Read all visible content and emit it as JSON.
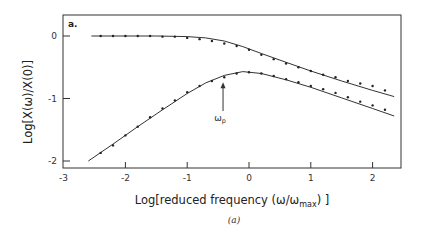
{
  "chart_data": {
    "type": "scatter",
    "panel_label": "a.",
    "caption": "(a)",
    "xlabel": "Log[reduced frequency (ω/ω",
    "xlabel_sub": "max",
    "xlabel_end": ") ]",
    "ylabel": "Log[X(ω)/X(0)]",
    "xlim": [
      -3,
      2.5
    ],
    "ylim": [
      -2.1,
      0.35
    ],
    "xticks": [
      -3,
      -2,
      -1,
      0,
      1,
      2
    ],
    "xtick_labels": [
      "-3",
      "-2",
      "-1",
      "0",
      "1",
      "2"
    ],
    "yticks": [
      0,
      -1,
      -2
    ],
    "ytick_labels": [
      "0",
      "-1",
      "-2"
    ],
    "grid": false,
    "annotation": {
      "text": "ω",
      "sub": "p",
      "x": -0.42,
      "arrow_from_y": -1.2,
      "arrow_to_y": -0.74
    },
    "series": [
      {
        "name": "upper (real part)",
        "line": [
          [
            -2.55,
            0
          ],
          [
            -2.0,
            0
          ],
          [
            -1.5,
            0
          ],
          [
            -1.0,
            -0.01
          ],
          [
            -0.7,
            -0.03
          ],
          [
            -0.4,
            -0.08
          ],
          [
            -0.1,
            -0.17
          ],
          [
            0.2,
            -0.28
          ],
          [
            0.6,
            -0.42
          ],
          [
            1.0,
            -0.56
          ],
          [
            1.5,
            -0.72
          ],
          [
            2.0,
            -0.87
          ],
          [
            2.35,
            -0.97
          ]
        ],
        "points": [
          [
            -2.4,
            0
          ],
          [
            -2.2,
            0
          ],
          [
            -2.0,
            0
          ],
          [
            -1.8,
            0
          ],
          [
            -1.6,
            0
          ],
          [
            -1.4,
            -0.01
          ],
          [
            -1.2,
            -0.01
          ],
          [
            -1.0,
            -0.03
          ],
          [
            -0.8,
            -0.05
          ],
          [
            -0.6,
            -0.08
          ],
          [
            -0.4,
            -0.12
          ],
          [
            -0.2,
            -0.16
          ],
          [
            0.0,
            -0.22
          ],
          [
            0.2,
            -0.3
          ],
          [
            0.4,
            -0.37
          ],
          [
            0.6,
            -0.44
          ],
          [
            0.8,
            -0.5
          ],
          [
            1.0,
            -0.56
          ],
          [
            1.2,
            -0.62
          ],
          [
            1.4,
            -0.66
          ],
          [
            1.6,
            -0.72
          ],
          [
            1.8,
            -0.76
          ],
          [
            2.0,
            -0.8
          ],
          [
            2.2,
            -0.87
          ]
        ]
      },
      {
        "name": "lower (imaginary part)",
        "line": [
          [
            -2.6,
            -2.0
          ],
          [
            -2.2,
            -1.73
          ],
          [
            -1.8,
            -1.45
          ],
          [
            -1.4,
            -1.18
          ],
          [
            -1.0,
            -0.92
          ],
          [
            -0.7,
            -0.75
          ],
          [
            -0.4,
            -0.63
          ],
          [
            -0.1,
            -0.57
          ],
          [
            0.2,
            -0.6
          ],
          [
            0.6,
            -0.7
          ],
          [
            1.0,
            -0.82
          ],
          [
            1.5,
            -0.99
          ],
          [
            2.0,
            -1.16
          ],
          [
            2.35,
            -1.28
          ]
        ],
        "points": [
          [
            -2.4,
            -1.87
          ],
          [
            -2.2,
            -1.75
          ],
          [
            -2.0,
            -1.59
          ],
          [
            -1.8,
            -1.45
          ],
          [
            -1.6,
            -1.3
          ],
          [
            -1.4,
            -1.16
          ],
          [
            -1.2,
            -1.03
          ],
          [
            -1.0,
            -0.9
          ],
          [
            -0.8,
            -0.8
          ],
          [
            -0.6,
            -0.72
          ],
          [
            -0.4,
            -0.66
          ],
          [
            -0.2,
            -0.6
          ],
          [
            0.0,
            -0.58
          ],
          [
            0.2,
            -0.6
          ],
          [
            0.4,
            -0.64
          ],
          [
            0.6,
            -0.69
          ],
          [
            0.8,
            -0.74
          ],
          [
            1.0,
            -0.8
          ],
          [
            1.2,
            -0.85
          ],
          [
            1.4,
            -0.91
          ],
          [
            1.6,
            -0.98
          ],
          [
            1.8,
            -1.05
          ],
          [
            2.0,
            -1.11
          ],
          [
            2.2,
            -1.18
          ]
        ]
      }
    ]
  }
}
